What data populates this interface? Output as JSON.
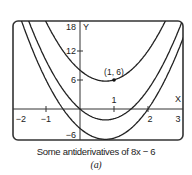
{
  "chart_data": {
    "type": "line",
    "title": "Some antiderivatives of 8x − 6",
    "subtitle": "(a)",
    "xlabel": "X",
    "ylabel": "Y",
    "xlim": [
      -2.35,
      3.05
    ],
    "ylim": [
      -6.6,
      18.5
    ],
    "x_ticks": [
      -2,
      -1,
      1,
      2,
      3
    ],
    "y_ticks": [
      18,
      12,
      6,
      -6
    ],
    "grid": false,
    "series": [
      {
        "name": "y = 4x^2 - 6x + 8",
        "expr": "4x^2-6x+8",
        "C": 8
      },
      {
        "name": "y = 4x^2 - 6x",
        "expr": "4x^2-6x",
        "C": 0
      },
      {
        "name": "y = 4x^2 - 6x - 4",
        "expr": "4x^2-6x-4",
        "C": -4
      }
    ],
    "annotations": [
      {
        "text": "(1, 6)",
        "x": 1,
        "y": 6,
        "marker": "dot"
      }
    ]
  },
  "labels": {
    "caption": "Some antiderivatives of 8x − 6",
    "sub": "(a)",
    "xaxis": "X",
    "yaxis": "Y",
    "point": "(1, 6)",
    "ticks": {
      "x_m2": "−2",
      "x_m1": "−1",
      "x_1": "1",
      "x_2": "2",
      "x_3": "3",
      "y_18": "18",
      "y_12": "12",
      "y_6": "6",
      "y_m6": "−6"
    }
  }
}
